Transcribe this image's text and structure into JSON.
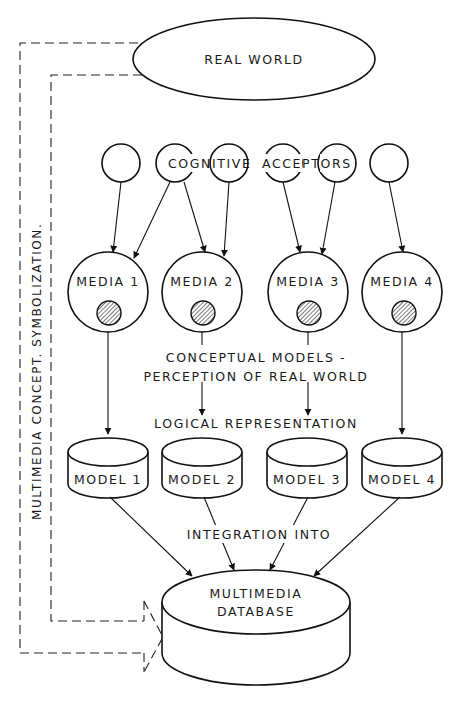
{
  "diagram": {
    "real_world": {
      "label": "REAL WORLD"
    },
    "cognitive_acceptors": {
      "label_part1": "COGNITIVE",
      "label_part2": "ACCEPTORS",
      "count": 6
    },
    "media": [
      {
        "label": "MEDIA 1"
      },
      {
        "label": "MEDIA 2"
      },
      {
        "label": "MEDIA 3"
      },
      {
        "label": "MEDIA 4"
      }
    ],
    "annotations": {
      "conceptual_line1": "CONCEPTUAL MODELS -",
      "conceptual_line2": "PERCEPTION OF REAL WORLD",
      "logical": "LOGICAL REPRESENTATION",
      "integration": "INTEGRATION INTO",
      "side_label": "MULTIMEDIA CONCEPT. SYMBOLIZATION."
    },
    "models": [
      {
        "label": "MODEL 1"
      },
      {
        "label": "MODEL 2"
      },
      {
        "label": "MODEL 3"
      },
      {
        "label": "MODEL 4"
      }
    ],
    "database": {
      "line1": "MULTIMEDIA",
      "line2": "DATABASE"
    },
    "colors": {
      "stroke": "#111111",
      "background": "#ffffff"
    }
  }
}
